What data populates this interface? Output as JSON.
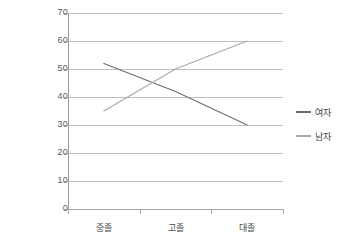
{
  "chart_data": {
    "type": "line",
    "title": "",
    "xlabel": "",
    "ylabel": "",
    "categories": [
      "중졸",
      "고졸",
      "대졸"
    ],
    "series": [
      {
        "name": "여자",
        "values": [
          52,
          42,
          30
        ],
        "color": "#6d6d6d"
      },
      {
        "name": "남자",
        "values": [
          35,
          50,
          60
        ],
        "color": "#a8a8a8"
      }
    ],
    "ylim": [
      0,
      70
    ],
    "yticks": [
      0,
      10,
      20,
      30,
      40,
      50,
      60,
      70
    ],
    "ytick_labels": [
      "0",
      "10",
      "20",
      "30",
      "40",
      "50",
      "60",
      "70"
    ],
    "grid": true,
    "legend_position": "right"
  },
  "legend": {
    "items": [
      {
        "label": "여자",
        "color": "#6d6d6d"
      },
      {
        "label": "남자",
        "color": "#a8a8a8"
      }
    ]
  },
  "axes": {
    "y_tick_labels": [
      "70",
      "60",
      "50",
      "40",
      "30",
      "20",
      "10",
      "0"
    ],
    "x_tick_labels": [
      "중졸",
      "고졸",
      "대졸"
    ]
  },
  "colors": {
    "series_women": "#6d6d6d",
    "series_men": "#a8a8a8",
    "gridline": "#bfbfbf",
    "axis": "#9a9a9a",
    "background": "#ffffff",
    "tick_text": "#5a5a5a"
  }
}
